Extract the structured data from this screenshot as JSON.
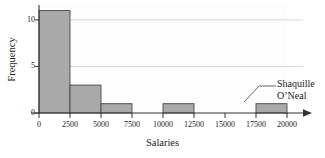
{
  "chart_data": {
    "type": "bar",
    "title": "",
    "subtitle": "",
    "xlabel": "Salaries",
    "ylabel": "Frequency",
    "xlim": [
      0,
      20000
    ],
    "ylim": [
      0,
      11.6
    ],
    "xticks": [
      "0",
      "2500",
      "5000",
      "7500",
      "10000",
      "12500",
      "15000",
      "17500",
      "20000"
    ],
    "xtick_values": [
      0,
      2500,
      5000,
      7500,
      10000,
      12500,
      15000,
      17500,
      20000
    ],
    "yticks": [
      "0",
      "5",
      "10"
    ],
    "ytick_values": [
      0,
      5,
      10
    ],
    "grid": "horizontal",
    "gridlines": [
      5,
      10
    ],
    "legend": "none",
    "bin_width": 2500,
    "bins": [
      {
        "label": "0-2500",
        "start": 0,
        "end": 2500,
        "value": 11
      },
      {
        "label": "2500-5000",
        "start": 2500,
        "end": 5000,
        "value": 3
      },
      {
        "label": "5000-7500",
        "start": 5000,
        "end": 7500,
        "value": 1
      },
      {
        "label": "7500-10000",
        "start": 7500,
        "end": 10000,
        "value": 0
      },
      {
        "label": "10000-12500",
        "start": 10000,
        "end": 12500,
        "value": 1
      },
      {
        "label": "12500-15000",
        "start": 12500,
        "end": 15000,
        "value": 0
      },
      {
        "label": "15000-17500",
        "start": 15000,
        "end": 17500,
        "value": 0
      },
      {
        "label": "17500-20000",
        "start": 17500,
        "end": 20000,
        "value": 1
      }
    ],
    "categories": [
      "0-2500",
      "2500-5000",
      "5000-7500",
      "7500-10000",
      "10000-12500",
      "12500-15000",
      "15000-17500",
      "17500-20000"
    ],
    "values": [
      11,
      3,
      1,
      0,
      1,
      0,
      0,
      1
    ],
    "annotations": [
      {
        "name": "shaquille-oneal-callout",
        "line1": "Shaquille",
        "line2": "O’Neal",
        "points_to_bin": "17500-20000"
      }
    ],
    "colors": {
      "bar_fill": "#a9a9a9",
      "bar_stroke": "#4a4a4a",
      "plot_background": "#fdfdfd",
      "gridline": "#d8d8d8",
      "axis": "#333333",
      "text": "#1a1a1a",
      "figure_background": "#ffffff"
    }
  },
  "axis": {
    "x_title": "Salaries",
    "y_title": "Frequency"
  }
}
